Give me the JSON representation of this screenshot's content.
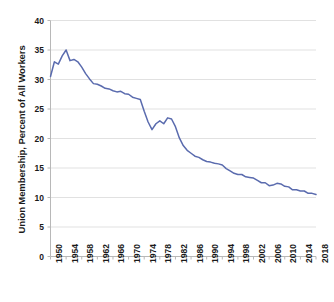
{
  "chart_data": {
    "type": "line",
    "title": "",
    "subtitle": "",
    "xlabel": "",
    "ylabel": "Union Membership, Percent of All Workers",
    "xlim": [
      1950,
      2018
    ],
    "ylim": [
      0,
      40
    ],
    "grid": true,
    "legend": false,
    "legend_position": "none",
    "series_color": "#5a6bae",
    "ytick_labels": [
      "0",
      "5",
      "10",
      "15",
      "20",
      "25",
      "30",
      "35",
      "40"
    ],
    "ytick_values": [
      0,
      5,
      10,
      15,
      20,
      25,
      30,
      35,
      40
    ],
    "xtick_labels": [
      "1950",
      "1954",
      "1958",
      "1962",
      "1966",
      "1970",
      "1974",
      "1978",
      "1982",
      "1986",
      "1990",
      "1994",
      "1998",
      "2002",
      "2006",
      "2010",
      "2014",
      "2018"
    ],
    "xtick_values": [
      1950,
      1954,
      1958,
      1962,
      1966,
      1970,
      1974,
      1978,
      1982,
      1986,
      1990,
      1994,
      1998,
      2002,
      2006,
      2010,
      2014,
      2018
    ],
    "series": [
      {
        "name": "Union Membership, Percent of All Workers",
        "x": [
          1950,
          1951,
          1952,
          1953,
          1954,
          1955,
          1956,
          1957,
          1958,
          1959,
          1960,
          1961,
          1962,
          1963,
          1964,
          1965,
          1966,
          1967,
          1968,
          1969,
          1970,
          1971,
          1972,
          1973,
          1974,
          1975,
          1976,
          1977,
          1978,
          1979,
          1980,
          1981,
          1982,
          1983,
          1984,
          1985,
          1986,
          1987,
          1988,
          1989,
          1990,
          1991,
          1992,
          1993,
          1994,
          1995,
          1996,
          1997,
          1998,
          1999,
          2000,
          2001,
          2002,
          2003,
          2004,
          2005,
          2006,
          2007,
          2008,
          2009,
          2010,
          2011,
          2012,
          2013,
          2014,
          2015,
          2016,
          2017,
          2018
        ],
        "values": [
          30.5,
          33.0,
          32.6,
          34.0,
          35.0,
          33.2,
          33.4,
          33.0,
          32.1,
          31.0,
          30.1,
          29.3,
          29.2,
          28.9,
          28.5,
          28.4,
          28.1,
          27.9,
          28.0,
          27.6,
          27.5,
          27.0,
          26.8,
          26.6,
          24.6,
          22.8,
          21.5,
          22.5,
          23.0,
          22.5,
          23.5,
          23.3,
          22.0,
          20.1,
          18.8,
          18.0,
          17.5,
          17.0,
          16.8,
          16.4,
          16.1,
          16.0,
          15.8,
          15.7,
          15.5,
          14.9,
          14.5,
          14.1,
          13.9,
          13.9,
          13.5,
          13.4,
          13.3,
          12.9,
          12.5,
          12.5,
          12.0,
          12.1,
          12.4,
          12.3,
          11.9,
          11.8,
          11.3,
          11.3,
          11.1,
          11.1,
          10.7,
          10.7,
          10.5
        ]
      }
    ]
  }
}
